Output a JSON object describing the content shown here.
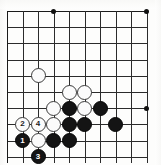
{
  "figure": {
    "kind": "go-board-diagram",
    "board": {
      "columns": 10,
      "rows": 10,
      "origin_x": 7,
      "origin_y": 11,
      "spacing_x": 15.55,
      "spacing_y": 16.2,
      "line_color": "#2b2b2b",
      "background_color": "#fdfdfc"
    },
    "star_points": [
      {
        "col": 3,
        "row": 0
      },
      {
        "col": 9,
        "row": 0
      },
      {
        "col": 9,
        "row": 6
      }
    ],
    "stones": [
      {
        "color": "white",
        "col": 2,
        "row": 4,
        "label": ""
      },
      {
        "color": "white",
        "col": 4,
        "row": 5,
        "label": ""
      },
      {
        "color": "white",
        "col": 5,
        "row": 5,
        "label": ""
      },
      {
        "color": "white",
        "col": 3,
        "row": 6,
        "label": ""
      },
      {
        "color": "black",
        "col": 4,
        "row": 6,
        "label": ""
      },
      {
        "color": "white",
        "col": 5,
        "row": 6,
        "label": ""
      },
      {
        "color": "black",
        "col": 6,
        "row": 6,
        "label": ""
      },
      {
        "color": "white",
        "col": 1,
        "row": 7,
        "label": "2"
      },
      {
        "color": "white",
        "col": 2,
        "row": 7,
        "label": "4"
      },
      {
        "color": "white",
        "col": 3,
        "row": 7,
        "label": ""
      },
      {
        "color": "black",
        "col": 4,
        "row": 7,
        "label": ""
      },
      {
        "color": "black",
        "col": 5,
        "row": 7,
        "label": ""
      },
      {
        "color": "black",
        "col": 7,
        "row": 7,
        "label": ""
      },
      {
        "color": "black",
        "col": 1,
        "row": 8,
        "label": "1"
      },
      {
        "color": "white",
        "col": 2,
        "row": 8,
        "label": ""
      },
      {
        "color": "black",
        "col": 3,
        "row": 8,
        "label": ""
      },
      {
        "color": "black",
        "col": 4,
        "row": 8,
        "label": ""
      },
      {
        "color": "black",
        "col": 2,
        "row": 9,
        "label": "3"
      }
    ],
    "move_labels": [
      "1",
      "2",
      "3",
      "4"
    ]
  }
}
